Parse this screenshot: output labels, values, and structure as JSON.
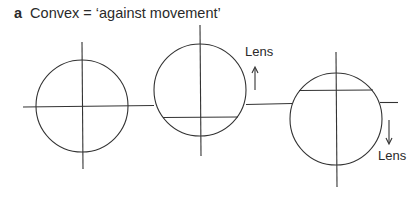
{
  "figure": {
    "panel_letter": "a",
    "title": "Convex = ‘against movement’"
  },
  "labels": {
    "lens_up": "Lens",
    "lens_down": "Lens"
  },
  "diagram": {
    "stroke_color": "#333333",
    "circles": [
      {
        "name": "neutral",
        "cx": 82,
        "cy": 106,
        "r": 46
      },
      {
        "name": "lens-moved-up",
        "cx": 200,
        "cy": 90,
        "r": 46
      },
      {
        "name": "lens-moved-down",
        "cx": 336,
        "cy": 119,
        "r": 46
      }
    ]
  }
}
